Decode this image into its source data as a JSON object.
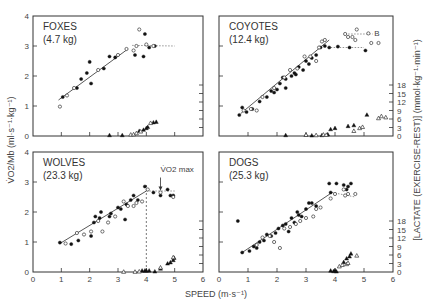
{
  "chart_data": {
    "type": "scatter",
    "figure_layout": "2x2 panels",
    "xlabel": "SPEED (m·s⁻¹)",
    "ylabel_left": "V̇O2/Mb (ml·s⁻¹·kg⁻¹)",
    "ylabel_right": "[LACTATE (EXERCISE-REST)] (mmol·kg⁻¹·min⁻¹)",
    "x_ticks": [
      "0",
      "1",
      "2",
      "3",
      "4",
      "5",
      "6"
    ],
    "xlim": [
      0,
      6
    ],
    "y_ticks": [
      "0",
      "1",
      "2",
      "3",
      "4"
    ],
    "ylim": [
      0,
      4
    ],
    "lactate_ticks": [
      "0",
      "3",
      "6",
      "9",
      "12",
      "15",
      "18"
    ],
    "lactate_lim": [
      0,
      18
    ],
    "annotation": "V̇O2 max",
    "legend": {
      "filled_circle": "V̇O2/Mb (animal A)",
      "open_circle": "V̇O2/Mb (animal B)",
      "filled_triangle": "lactate (animal A)",
      "open_triangle": "lactate (animal B)"
    },
    "panels": [
      {
        "id": "foxes",
        "title": "FOXES",
        "mass": "(4.7 kg)",
        "show_left_ticks": true,
        "show_right_ticks": false,
        "show_x_labels": false,
        "fit_line": [
          [
            0.9,
            1.2
          ],
          [
            3.35,
            2.9
          ]
        ],
        "plateau": [
          [
            3.5,
            3.02
          ],
          [
            5.0,
            3.0
          ]
        ],
        "vo2_filled": [
          [
            1.05,
            1.3
          ],
          [
            1.55,
            1.6
          ],
          [
            1.9,
            2.1
          ],
          [
            2.0,
            2.47
          ],
          [
            2.05,
            1.75
          ],
          [
            1.7,
            1.9
          ],
          [
            2.5,
            2.25
          ],
          [
            2.7,
            2.65
          ],
          [
            2.9,
            2.62
          ],
          [
            3.6,
            2.7
          ],
          [
            3.9,
            2.65
          ],
          [
            3.95,
            3.4
          ],
          [
            4.3,
            3.0
          ],
          [
            4.1,
            2.95
          ]
        ],
        "vo2_open": [
          [
            0.95,
            0.98
          ],
          [
            1.2,
            1.35
          ],
          [
            1.45,
            1.6
          ],
          [
            2.3,
            2.2
          ],
          [
            3.0,
            2.7
          ],
          [
            3.3,
            2.9
          ],
          [
            3.55,
            2.85
          ],
          [
            3.65,
            3.0
          ],
          [
            3.75,
            3.55
          ],
          [
            4.0,
            3.05
          ],
          [
            4.25,
            3.0
          ]
        ],
        "lactate_filled": [
          [
            2.7,
            0.3
          ],
          [
            3.15,
            0.3
          ],
          [
            3.75,
            1.8
          ],
          [
            3.9,
            2.2
          ],
          [
            4.0,
            2.8
          ],
          [
            4.05,
            3.2
          ],
          [
            4.25,
            4.8
          ],
          [
            4.35,
            5.0
          ]
        ],
        "lactate_open": [
          [
            3.45,
            0.5
          ],
          [
            3.55,
            0.6
          ],
          [
            3.65,
            1.0
          ],
          [
            3.8,
            1.6
          ],
          [
            4.15,
            4.6
          ]
        ]
      },
      {
        "id": "coyotes",
        "title": "COYOTES",
        "mass": "(12.4 kg)",
        "show_left_ticks": false,
        "show_right_ticks": true,
        "show_x_labels": false,
        "fit_line": [
          [
            0.75,
            0.75
          ],
          [
            3.8,
            3.2
          ]
        ],
        "plateau": [
          [
            3.85,
            2.95
          ],
          [
            5.0,
            2.95
          ]
        ],
        "plateau2": [
          [
            4.35,
            3.4
          ],
          [
            5.3,
            3.4
          ]
        ],
        "plateau_label": "B",
        "vo2_filled": [
          [
            0.7,
            0.7
          ],
          [
            0.8,
            0.95
          ],
          [
            0.95,
            0.8
          ],
          [
            1.15,
            0.9
          ],
          [
            1.4,
            1.15
          ],
          [
            1.65,
            1.3
          ],
          [
            1.8,
            1.5
          ],
          [
            2.0,
            1.55
          ],
          [
            2.1,
            1.75
          ],
          [
            2.2,
            1.95
          ],
          [
            2.3,
            1.9
          ],
          [
            2.5,
            2.0
          ],
          [
            2.6,
            2.1
          ],
          [
            2.75,
            2.3
          ],
          [
            2.9,
            2.2
          ],
          [
            3.0,
            2.5
          ],
          [
            3.1,
            2.4
          ],
          [
            3.2,
            2.6
          ],
          [
            3.35,
            2.7
          ],
          [
            3.5,
            2.95
          ],
          [
            3.65,
            3.0
          ],
          [
            3.8,
            2.95
          ],
          [
            4.1,
            2.98
          ],
          [
            4.5,
            2.95
          ],
          [
            5.05,
            2.85
          ],
          [
            1.9,
            1.45
          ],
          [
            2.3,
            1.6
          ],
          [
            2.65,
            2.05
          ]
        ],
        "vo2_open": [
          [
            0.85,
            0.85
          ],
          [
            1.1,
            0.9
          ],
          [
            1.3,
            0.85
          ],
          [
            1.5,
            1.3
          ],
          [
            1.9,
            1.6
          ],
          [
            2.25,
            1.95
          ],
          [
            2.45,
            2.2
          ],
          [
            2.7,
            2.25
          ],
          [
            2.95,
            2.65
          ],
          [
            3.15,
            2.65
          ],
          [
            3.35,
            2.5
          ],
          [
            3.45,
            2.95
          ],
          [
            3.55,
            3.15
          ],
          [
            3.65,
            3.2
          ],
          [
            4.35,
            3.4
          ],
          [
            4.45,
            3.3
          ],
          [
            4.6,
            3.3
          ],
          [
            4.7,
            3.2
          ],
          [
            4.75,
            3.55
          ],
          [
            5.25,
            3.1
          ],
          [
            5.5,
            3.1
          ],
          [
            5.15,
            3.42
          ]
        ],
        "lactate_filled": [
          [
            2.3,
            0.3
          ],
          [
            3.0,
            0.4
          ],
          [
            3.2,
            0.2
          ],
          [
            3.55,
            0.3
          ],
          [
            3.75,
            0.6
          ],
          [
            3.85,
            2.4
          ],
          [
            4.0,
            2.8
          ],
          [
            4.45,
            3.5
          ],
          [
            4.65,
            3.8
          ],
          [
            5.1,
            7.5
          ]
        ],
        "lactate_open": [
          [
            3.0,
            0.4
          ],
          [
            3.35,
            0.3
          ],
          [
            3.6,
            0.5
          ],
          [
            3.7,
            0.4
          ],
          [
            4.65,
            1.8
          ],
          [
            4.85,
            2.8
          ],
          [
            4.95,
            3.2
          ],
          [
            5.5,
            6.3
          ],
          [
            5.6,
            7.0
          ],
          [
            5.75,
            6.6
          ]
        ]
      },
      {
        "id": "wolves",
        "title": "WOLVES",
        "mass": "(23.3 kg)",
        "show_left_ticks": true,
        "show_right_ticks": false,
        "show_x_labels": true,
        "fit_line": [
          [
            0.95,
            0.95
          ],
          [
            4.0,
            2.7
          ]
        ],
        "plateau": [
          [
            4.0,
            2.7
          ],
          [
            5.0,
            2.7
          ]
        ],
        "vmax_x": 4.0,
        "vo2_filled": [
          [
            0.95,
            0.98
          ],
          [
            1.35,
            0.93
          ],
          [
            1.6,
            1.05
          ],
          [
            2.05,
            1.2
          ],
          [
            2.15,
            1.65
          ],
          [
            2.2,
            1.85
          ],
          [
            2.35,
            1.8
          ],
          [
            2.4,
            2.0
          ],
          [
            2.7,
            1.85
          ],
          [
            2.75,
            1.95
          ],
          [
            3.0,
            2.15
          ],
          [
            3.1,
            2.1
          ],
          [
            3.25,
            1.75
          ],
          [
            3.3,
            2.25
          ],
          [
            3.45,
            2.4
          ],
          [
            3.55,
            2.55
          ],
          [
            3.7,
            2.4
          ],
          [
            3.95,
            2.85
          ],
          [
            4.25,
            2.65
          ],
          [
            4.5,
            2.55
          ],
          [
            4.75,
            2.75
          ],
          [
            4.85,
            2.55
          ],
          [
            4.95,
            2.55
          ]
        ],
        "vo2_open": [
          [
            1.15,
            0.95
          ],
          [
            1.55,
            1.3
          ],
          [
            1.8,
            1.25
          ],
          [
            2.05,
            1.35
          ],
          [
            2.3,
            1.7
          ],
          [
            2.45,
            1.35
          ],
          [
            2.65,
            1.65
          ],
          [
            2.9,
            1.85
          ],
          [
            3.2,
            2.35
          ],
          [
            3.35,
            2.2
          ],
          [
            3.55,
            2.2
          ],
          [
            3.65,
            2.3
          ],
          [
            3.85,
            2.35
          ],
          [
            4.05,
            2.75
          ],
          [
            4.5,
            2.65
          ],
          [
            4.95,
            2.5
          ]
        ],
        "lactate_filled": [
          [
            3.85,
            0.5
          ],
          [
            3.95,
            0.5
          ],
          [
            4.0,
            0.5
          ],
          [
            4.1,
            0.5
          ],
          [
            4.3,
            0.2
          ],
          [
            4.5,
            1.2
          ],
          [
            4.75,
            3.0
          ],
          [
            4.85,
            3.4
          ],
          [
            4.95,
            4.2
          ],
          [
            4.98,
            5.0
          ]
        ],
        "lactate_open": [
          [
            3.2,
            0.1
          ],
          [
            3.6,
            0.1
          ],
          [
            3.75,
            0.2
          ],
          [
            4.5,
            1.6
          ],
          [
            4.95,
            5.2
          ]
        ]
      },
      {
        "id": "dogs",
        "title": "DOGS",
        "mass": "(25.3 kg)",
        "show_left_ticks": false,
        "show_right_ticks": true,
        "show_x_labels": true,
        "fit_line": [
          [
            0.8,
            0.65
          ],
          [
            3.9,
            2.65
          ]
        ],
        "plateau": [
          [
            3.9,
            2.65
          ],
          [
            4.7,
            2.5
          ]
        ],
        "vo2_filled": [
          [
            0.65,
            1.7
          ],
          [
            0.8,
            0.65
          ],
          [
            1.05,
            0.7
          ],
          [
            1.2,
            0.85
          ],
          [
            1.3,
            0.8
          ],
          [
            1.4,
            1.0
          ],
          [
            1.55,
            1.05
          ],
          [
            1.65,
            1.25
          ],
          [
            1.8,
            1.2
          ],
          [
            1.95,
            1.3
          ],
          [
            2.05,
            1.45
          ],
          [
            2.2,
            1.55
          ],
          [
            2.3,
            1.6
          ],
          [
            2.4,
            1.35
          ],
          [
            2.5,
            1.8
          ],
          [
            2.6,
            1.65
          ],
          [
            2.7,
            2.0
          ],
          [
            2.75,
            1.9
          ],
          [
            2.85,
            1.85
          ],
          [
            3.0,
            2.1
          ],
          [
            3.1,
            2.3
          ],
          [
            3.2,
            2.3
          ],
          [
            3.35,
            2.2
          ],
          [
            3.8,
            2.95
          ],
          [
            3.85,
            2.65
          ],
          [
            4.05,
            2.95
          ],
          [
            4.3,
            2.9
          ],
          [
            4.45,
            2.85
          ],
          [
            4.55,
            2.95
          ],
          [
            4.4,
            2.75
          ]
        ],
        "vo2_open": [
          [
            1.3,
            0.9
          ],
          [
            1.5,
            1.15
          ],
          [
            1.75,
            1.2
          ],
          [
            1.9,
            1.0
          ],
          [
            2.1,
            0.8
          ],
          [
            2.25,
            1.45
          ],
          [
            2.45,
            1.5
          ],
          [
            2.65,
            1.6
          ],
          [
            2.8,
            1.7
          ],
          [
            3.0,
            1.8
          ],
          [
            3.25,
            1.85
          ],
          [
            3.35,
            2.1
          ],
          [
            3.5,
            2.15
          ],
          [
            3.85,
            2.45
          ],
          [
            4.0,
            2.6
          ],
          [
            4.3,
            2.75
          ],
          [
            4.35,
            2.55
          ],
          [
            4.45,
            2.6
          ],
          [
            4.7,
            2.6
          ]
        ],
        "lactate_filled": [
          [
            3.85,
            0.5
          ],
          [
            3.95,
            0.3
          ],
          [
            4.0,
            0.6
          ],
          [
            4.05,
            0.2
          ],
          [
            4.3,
            3.5
          ],
          [
            4.4,
            4.8
          ],
          [
            4.5,
            5.5
          ],
          [
            4.55,
            6.5
          ]
        ],
        "lactate_open": [
          [
            4.15,
            2.0
          ],
          [
            4.25,
            2.5
          ],
          [
            4.4,
            2.8
          ],
          [
            4.45,
            3.2
          ],
          [
            4.75,
            5.8
          ]
        ]
      }
    ]
  }
}
